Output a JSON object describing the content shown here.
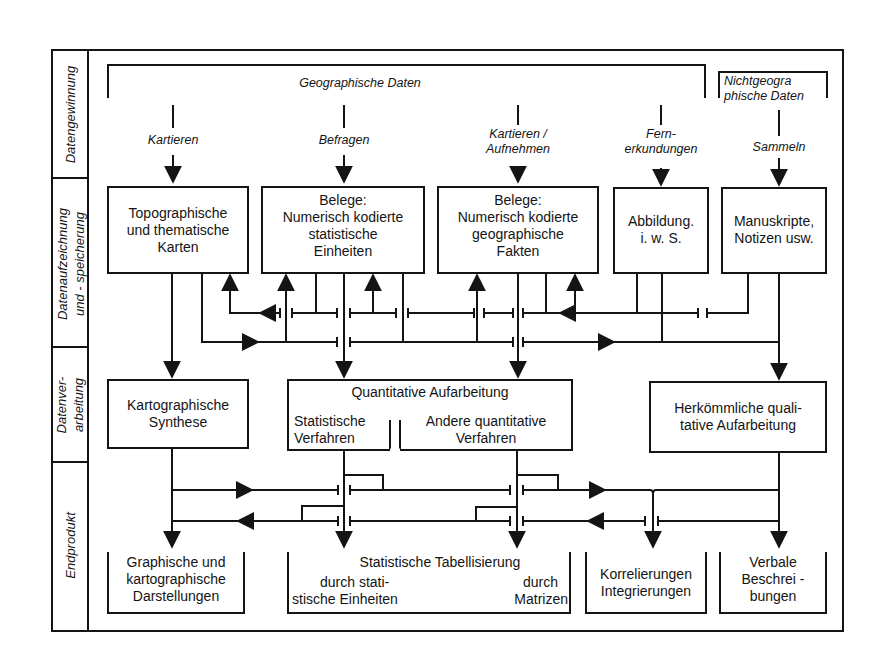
{
  "sections": [
    {
      "id": "datengewinnung",
      "label": "Datengewinnung"
    },
    {
      "id": "datenaufzeichnung",
      "label_line1": "Datenaufzeichnung",
      "label_line2": "und - speicherung"
    },
    {
      "id": "datenverarbeitung",
      "label_line1": "Datenver-",
      "label_line2": "arbeitung"
    },
    {
      "id": "endprodukt",
      "label": "Endprodukt"
    }
  ],
  "sources": {
    "geographic": "Geographische Daten",
    "nongeographic_line1": "Nichtgeogra",
    "nongeographic_line2": "phische Daten"
  },
  "methods": [
    {
      "line1": "Kartieren",
      "line2": ""
    },
    {
      "line1": "Befragen",
      "line2": ""
    },
    {
      "line1": "Kartieren /",
      "line2": "Aufnehmen"
    },
    {
      "line1": "Fern-",
      "line2": "erkundungen"
    },
    {
      "line1": "Sammeln",
      "line2": ""
    }
  ],
  "storage": [
    {
      "lines": [
        "Topographische",
        "und thematische",
        "Karten"
      ]
    },
    {
      "lines": [
        "Belege:",
        "Numerisch kodierte",
        "statistische",
        "Einheiten"
      ]
    },
    {
      "lines": [
        "Belege:",
        "Numerisch kodierte",
        "geographische",
        "Fakten"
      ]
    },
    {
      "lines": [
        "Abbildung.",
        "i. w. S."
      ]
    },
    {
      "lines": [
        "Manuskripte,",
        "Notizen usw."
      ]
    }
  ],
  "processing": {
    "kartographisch": [
      "Kartographische",
      "Synthese"
    ],
    "quantitative_title": "Quantitative Aufarbeitung",
    "statistische": [
      "Statistische",
      "Verfahren"
    ],
    "andere": [
      "Andere quantitative",
      "Verfahren"
    ],
    "qualitativ": [
      "Herkömmliche quali-",
      "tative Aufarbeitung"
    ]
  },
  "products": {
    "graphische": [
      "Graphische und",
      "kartographische",
      "Darstellungen"
    ],
    "tabellisierung_title": "Statistische Tabellisierung",
    "tabellisierung_left": [
      "durch stati-",
      "stische Einheiten"
    ],
    "tabellisierung_right": [
      "durch",
      "Matrizen"
    ],
    "korrelierungen": [
      "Korrelierungen",
      "Integrierungen"
    ],
    "verbale": [
      "Verbale",
      "Beschrei -",
      "bungen"
    ]
  },
  "colors": {
    "ink": "#141414",
    "paper": "#ffffff"
  }
}
